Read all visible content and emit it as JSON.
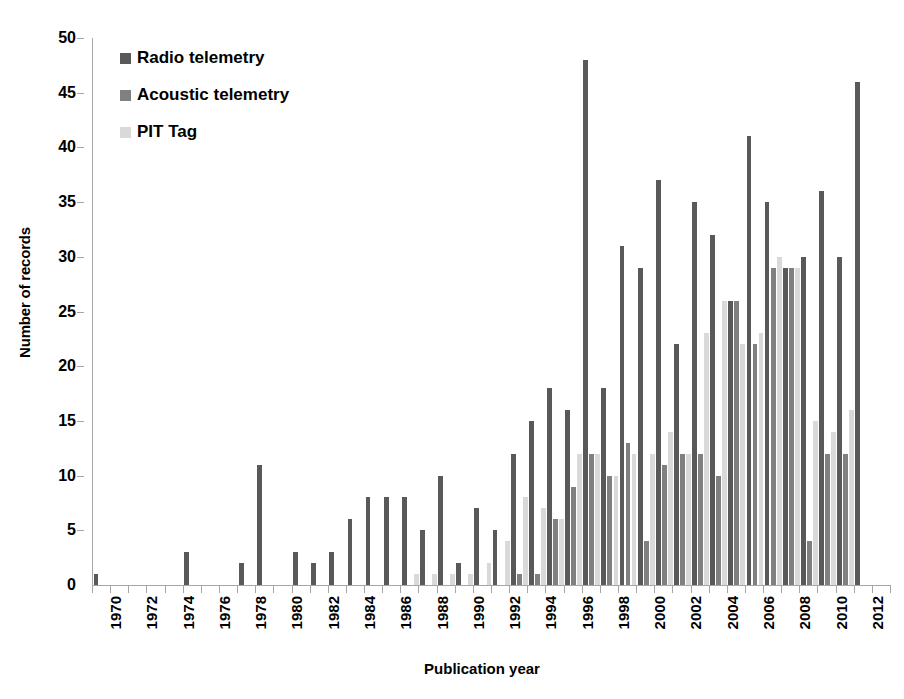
{
  "chart_data": {
    "type": "bar",
    "title": "",
    "xlabel": "Publication year",
    "ylabel": "Number of records",
    "ylim": [
      0,
      50
    ],
    "yticks": [
      0,
      5,
      10,
      15,
      20,
      25,
      30,
      35,
      40,
      45,
      50
    ],
    "grid": false,
    "legend_position": "top-left",
    "x": [
      1970,
      1971,
      1972,
      1973,
      1974,
      1975,
      1976,
      1977,
      1978,
      1979,
      1980,
      1981,
      1982,
      1983,
      1984,
      1985,
      1986,
      1987,
      1988,
      1989,
      1990,
      1991,
      1992,
      1993,
      1994,
      1995,
      1996,
      1997,
      1998,
      1999,
      2000,
      2001,
      2002,
      2003,
      2004,
      2005,
      2006,
      2007,
      2008,
      2009,
      2010,
      2011,
      2012,
      2013
    ],
    "xtick_labels": [
      "1970",
      "1972",
      "1974",
      "1976",
      "1978",
      "1980",
      "1982",
      "1984",
      "1986",
      "1988",
      "1990",
      "1992",
      "1994",
      "1996",
      "1998",
      "2000",
      "2002",
      "2004",
      "2006",
      "2008",
      "2010",
      "2012"
    ],
    "series": [
      {
        "name": "Radio telemetry",
        "color": "#595959",
        "values": [
          1,
          0,
          0,
          0,
          0,
          3,
          0,
          0,
          2,
          11,
          0,
          3,
          2,
          3,
          6,
          8,
          8,
          8,
          5,
          10,
          2,
          7,
          5,
          12,
          15,
          18,
          16,
          48,
          18,
          31,
          29,
          37,
          22,
          35,
          32,
          26,
          41,
          35,
          29,
          30,
          36,
          30,
          46,
          0
        ]
      },
      {
        "name": "Acoustic telemetry",
        "color": "#808080",
        "values": [
          0,
          0,
          0,
          0,
          0,
          0,
          0,
          0,
          0,
          0,
          0,
          0,
          0,
          0,
          0,
          0,
          0,
          0,
          0,
          0,
          0,
          0,
          0,
          1,
          1,
          6,
          9,
          12,
          10,
          13,
          4,
          11,
          12,
          12,
          10,
          26,
          22,
          29,
          29,
          4,
          12,
          12,
          0,
          0
        ]
      },
      {
        "name": "PIT Tag",
        "color": "#d9d9d9",
        "values": [
          0,
          0,
          0,
          0,
          0,
          0,
          0,
          0,
          0,
          0,
          0,
          0,
          0,
          0,
          0,
          0,
          0,
          1,
          1,
          1,
          1,
          2,
          4,
          8,
          7,
          6,
          12,
          12,
          10,
          12,
          12,
          14,
          12,
          23,
          26,
          22,
          23,
          30,
          29,
          15,
          14,
          16,
          0,
          0
        ]
      }
    ]
  },
  "legend": {
    "items": [
      {
        "label": "Radio telemetry",
        "color": "#595959"
      },
      {
        "label": "Acoustic telemetry",
        "color": "#808080"
      },
      {
        "label": "PIT Tag",
        "color": "#d9d9d9"
      }
    ]
  },
  "axes": {
    "y_title": "Number of records",
    "x_title": "Publication year"
  }
}
